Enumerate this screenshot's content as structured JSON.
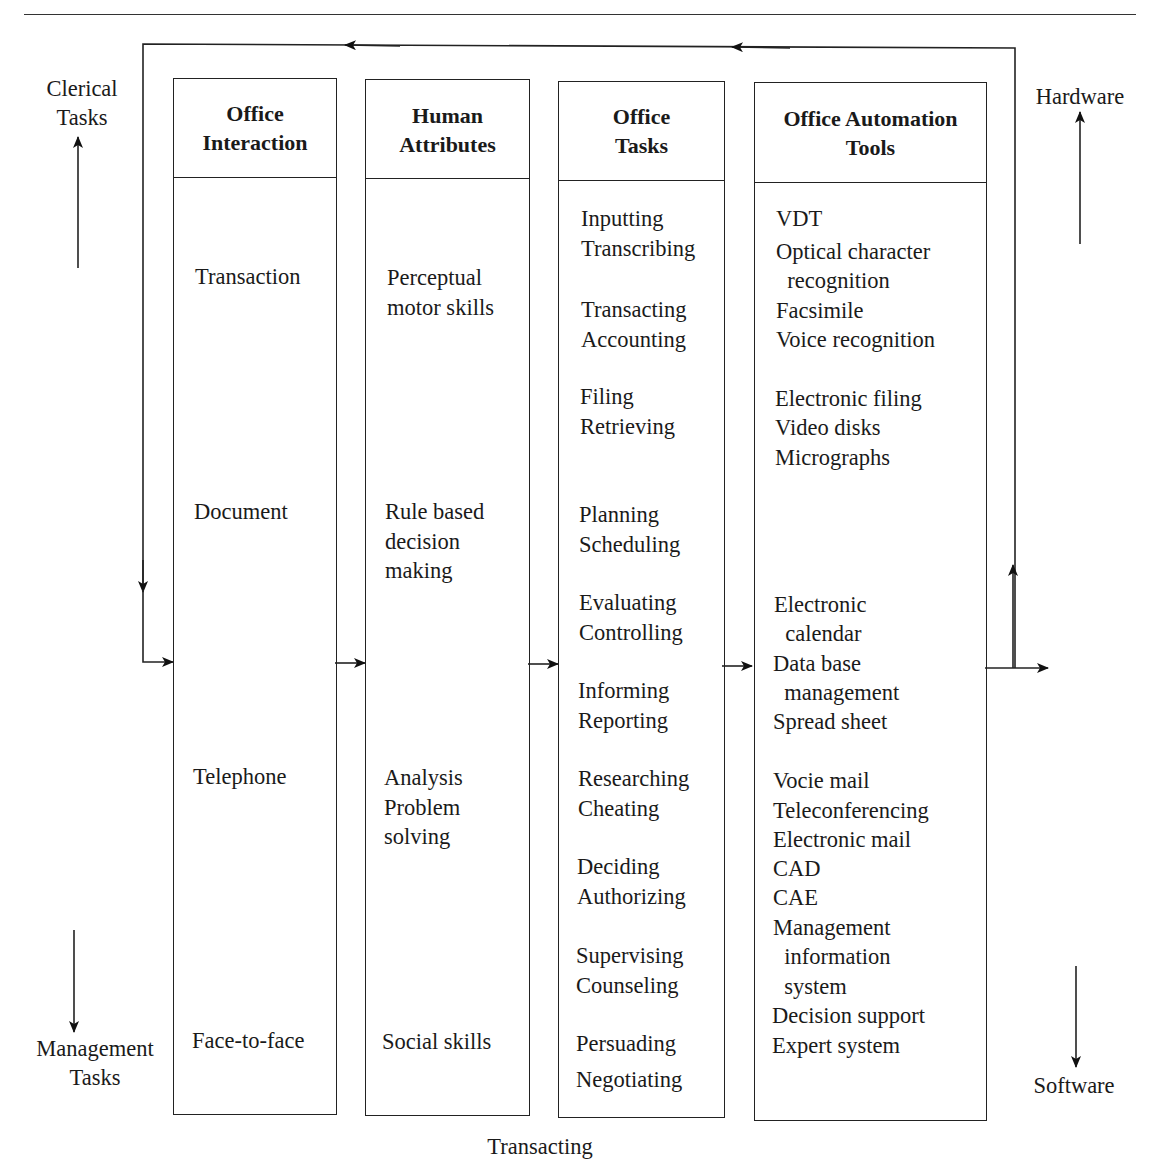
{
  "side_labels": {
    "top_left": "Clerical\nTasks",
    "bottom_left": "Management\nTasks",
    "top_right": "Hardware",
    "bottom_right": "Software",
    "bottom_center": "Transacting"
  },
  "columns": [
    {
      "id": "office-interaction",
      "title": "Office\nInteraction",
      "items": [
        {
          "text": "Transaction",
          "x": 195,
          "y": 262
        },
        {
          "text": "Document",
          "x": 194,
          "y": 497
        },
        {
          "text": "Telephone",
          "x": 193,
          "y": 762
        },
        {
          "text": "Face-to-face",
          "x": 192,
          "y": 1026
        }
      ]
    },
    {
      "id": "human-attributes",
      "title": "Human\nAttributes",
      "items": [
        {
          "text": "Perceptual\nmotor skills",
          "x": 387,
          "y": 263
        },
        {
          "text": "Rule based\ndecision\nmaking",
          "x": 385,
          "y": 497
        },
        {
          "text": "Analysis\nProblem\nsolving",
          "x": 384,
          "y": 763
        },
        {
          "text": "Social skills",
          "x": 382,
          "y": 1027
        }
      ]
    },
    {
      "id": "office-tasks",
      "title": "Office\nTasks",
      "items": [
        {
          "text": "Inputting\nTranscribing",
          "x": 581,
          "y": 204
        },
        {
          "text": "Transacting\nAccounting",
          "x": 581,
          "y": 295
        },
        {
          "text": "Filing\nRetrieving",
          "x": 580,
          "y": 382
        },
        {
          "text": "Planning\nScheduling",
          "x": 579,
          "y": 500
        },
        {
          "text": "Evaluating\nControlling",
          "x": 579,
          "y": 588
        },
        {
          "text": "Informing\nReporting",
          "x": 578,
          "y": 676
        },
        {
          "text": "Researching\nCheating",
          "x": 578,
          "y": 764
        },
        {
          "text": "Deciding\nAuthorizing",
          "x": 577,
          "y": 852
        },
        {
          "text": "Supervising\nCounseling",
          "x": 576,
          "y": 941
        },
        {
          "text": "Persuading",
          "x": 576,
          "y": 1029
        },
        {
          "text": "Negotiating",
          "x": 576,
          "y": 1065
        }
      ]
    },
    {
      "id": "office-automation-tools",
      "title": "Office Automation\nTools",
      "items": [
        {
          "text": "VDT",
          "x": 776,
          "y": 204
        },
        {
          "text": "Optical character",
          "x": 776,
          "y": 237
        },
        {
          "text": "  recognition",
          "x": 776,
          "y": 266
        },
        {
          "text": "Facsimile",
          "x": 776,
          "y": 296
        },
        {
          "text": "Voice recognition",
          "x": 776,
          "y": 325
        },
        {
          "text": "Electronic filing",
          "x": 775,
          "y": 384
        },
        {
          "text": "Video disks",
          "x": 775,
          "y": 413
        },
        {
          "text": "Micrographs",
          "x": 775,
          "y": 443
        },
        {
          "text": "Electronic",
          "x": 774,
          "y": 590
        },
        {
          "text": "  calendar",
          "x": 774,
          "y": 619
        },
        {
          "text": "Data base",
          "x": 773,
          "y": 649
        },
        {
          "text": "  management",
          "x": 773,
          "y": 678
        },
        {
          "text": "Spread sheet",
          "x": 773,
          "y": 707
        },
        {
          "text": "Vocie mail",
          "x": 773,
          "y": 766
        },
        {
          "text": "Teleconferencing",
          "x": 773,
          "y": 796
        },
        {
          "text": "Electronic mail",
          "x": 773,
          "y": 825
        },
        {
          "text": "CAD",
          "x": 773,
          "y": 854
        },
        {
          "text": "CAE",
          "x": 773,
          "y": 883
        },
        {
          "text": "Management",
          "x": 773,
          "y": 913
        },
        {
          "text": "  information",
          "x": 773,
          "y": 942
        },
        {
          "text": "  system",
          "x": 773,
          "y": 972
        },
        {
          "text": "Decision support",
          "x": 772,
          "y": 1001
        },
        {
          "text": "Expert system",
          "x": 772,
          "y": 1031
        }
      ]
    }
  ],
  "colors": {
    "line": "#222222",
    "text": "#1a1a1a",
    "background": "#ffffff"
  }
}
